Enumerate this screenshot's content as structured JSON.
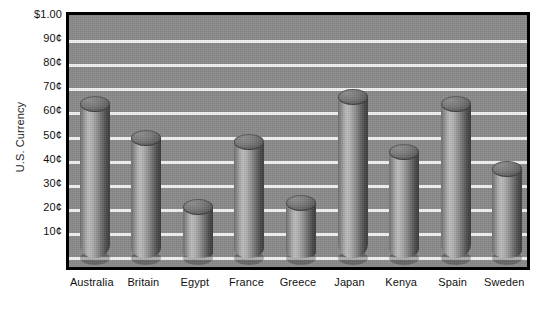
{
  "chart_data": {
    "type": "bar",
    "title": "",
    "subtitle": "",
    "xlabel": "",
    "ylabel": "U.S. Currency",
    "categories": [
      "Australia",
      "Britain",
      "Egypt",
      "France",
      "Greece",
      "Japan",
      "Kenya",
      "Spain",
      "Sweden"
    ],
    "values": [
      64,
      50,
      21,
      48,
      23,
      67,
      44,
      64,
      37
    ],
    "value_unit": "cents",
    "ylim": [
      0,
      100
    ],
    "ytick_values": [
      100,
      90,
      80,
      70,
      60,
      50,
      40,
      30,
      20,
      10
    ],
    "ytick_labels": [
      "$1.00",
      "90¢",
      "80¢",
      "70¢",
      "60¢",
      "50¢",
      "40¢",
      "30¢",
      "20¢",
      "10¢"
    ],
    "grid": true,
    "grid_color": "#f2f2f2",
    "legend": false,
    "legend_position": "none",
    "style": "3d-cylinder",
    "plot_background": "#8a8a8a",
    "bar_color": "#9a9a9a",
    "frame_color": "#000000",
    "text_color": "#111111",
    "series": [
      {
        "name": "Value of one unit of local currency",
        "values": [
          64,
          50,
          21,
          48,
          23,
          67,
          44,
          64,
          37
        ]
      }
    ]
  }
}
